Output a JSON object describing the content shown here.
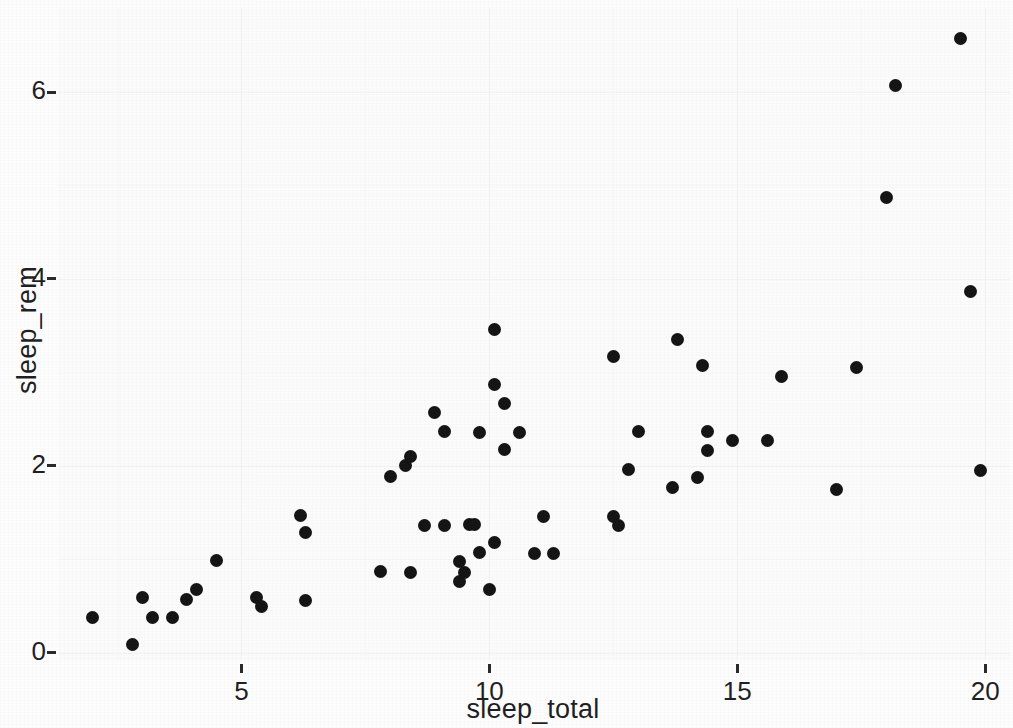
{
  "chart_data": {
    "type": "scatter",
    "title": "",
    "subtitle": "",
    "xlabel": "sleep_total",
    "ylabel": "sleep_rem",
    "xlim": [
      1.3,
      20.5
    ],
    "ylim": [
      -0.08,
      6.9
    ],
    "x_ticks": [
      5,
      10,
      15,
      20
    ],
    "y_ticks": [
      0,
      2,
      4,
      6
    ],
    "x_tick_labels": [
      "5",
      "10",
      "15",
      "20"
    ],
    "y_tick_labels": [
      "0",
      "2",
      "4",
      "6"
    ],
    "grid": "faint",
    "legend": null,
    "point_color": "#141414",
    "panel_background": "#fbfbfb",
    "points": [
      {
        "x": 2.0,
        "y": 0.38
      },
      {
        "x": 2.8,
        "y": 0.09
      },
      {
        "x": 3.0,
        "y": 0.59
      },
      {
        "x": 3.2,
        "y": 0.38
      },
      {
        "x": 3.6,
        "y": 0.38
      },
      {
        "x": 3.9,
        "y": 0.57
      },
      {
        "x": 4.1,
        "y": 0.67
      },
      {
        "x": 4.5,
        "y": 0.98
      },
      {
        "x": 5.3,
        "y": 0.59
      },
      {
        "x": 5.4,
        "y": 0.49
      },
      {
        "x": 6.2,
        "y": 1.47
      },
      {
        "x": 6.3,
        "y": 1.28
      },
      {
        "x": 6.3,
        "y": 0.56
      },
      {
        "x": 7.8,
        "y": 0.87
      },
      {
        "x": 8.0,
        "y": 1.88
      },
      {
        "x": 8.3,
        "y": 2.0
      },
      {
        "x": 8.4,
        "y": 2.1
      },
      {
        "x": 8.4,
        "y": 0.86
      },
      {
        "x": 8.7,
        "y": 1.36
      },
      {
        "x": 8.9,
        "y": 2.57
      },
      {
        "x": 9.1,
        "y": 2.37
      },
      {
        "x": 9.1,
        "y": 1.36
      },
      {
        "x": 9.4,
        "y": 0.97
      },
      {
        "x": 9.4,
        "y": 0.76
      },
      {
        "x": 9.5,
        "y": 0.86
      },
      {
        "x": 9.6,
        "y": 1.37
      },
      {
        "x": 9.7,
        "y": 1.37
      },
      {
        "x": 9.8,
        "y": 2.36
      },
      {
        "x": 9.8,
        "y": 1.07
      },
      {
        "x": 10.0,
        "y": 0.68
      },
      {
        "x": 10.1,
        "y": 3.46
      },
      {
        "x": 10.1,
        "y": 2.87
      },
      {
        "x": 10.1,
        "y": 1.18
      },
      {
        "x": 10.3,
        "y": 2.67
      },
      {
        "x": 10.3,
        "y": 2.17
      },
      {
        "x": 10.6,
        "y": 2.36
      },
      {
        "x": 10.9,
        "y": 1.06
      },
      {
        "x": 11.1,
        "y": 1.46
      },
      {
        "x": 11.3,
        "y": 1.06
      },
      {
        "x": 12.5,
        "y": 3.17
      },
      {
        "x": 12.5,
        "y": 1.46
      },
      {
        "x": 12.6,
        "y": 1.36
      },
      {
        "x": 12.8,
        "y": 1.96
      },
      {
        "x": 13.0,
        "y": 2.37
      },
      {
        "x": 13.7,
        "y": 1.77
      },
      {
        "x": 13.8,
        "y": 3.35
      },
      {
        "x": 14.2,
        "y": 1.87
      },
      {
        "x": 14.3,
        "y": 3.07
      },
      {
        "x": 14.4,
        "y": 2.37
      },
      {
        "x": 14.4,
        "y": 2.16
      },
      {
        "x": 14.9,
        "y": 2.27
      },
      {
        "x": 15.6,
        "y": 2.27
      },
      {
        "x": 15.9,
        "y": 2.96
      },
      {
        "x": 17.0,
        "y": 1.75
      },
      {
        "x": 17.4,
        "y": 3.05
      },
      {
        "x": 18.0,
        "y": 4.87
      },
      {
        "x": 18.2,
        "y": 6.07
      },
      {
        "x": 19.5,
        "y": 6.57
      },
      {
        "x": 19.7,
        "y": 3.86
      },
      {
        "x": 19.9,
        "y": 1.95
      }
    ]
  }
}
